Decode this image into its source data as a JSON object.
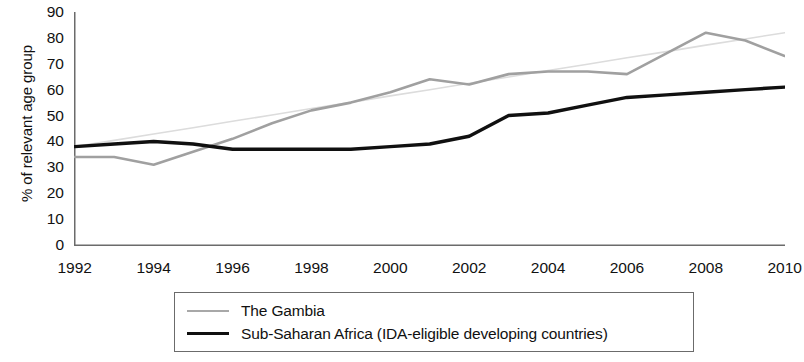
{
  "chart_data": {
    "type": "line",
    "title": "",
    "xlabel": "",
    "ylabel": "% of relevant age group",
    "xlim": [
      1992,
      2010
    ],
    "ylim": [
      0,
      90
    ],
    "grid": false,
    "legend_position": "bottom",
    "x": [
      1992,
      1993,
      1994,
      1995,
      1996,
      1997,
      1998,
      1999,
      2000,
      2001,
      2002,
      2003,
      2004,
      2005,
      2006,
      2007,
      2008,
      2009,
      2010
    ],
    "xticks": [
      1992,
      1994,
      1996,
      1998,
      2000,
      2002,
      2004,
      2006,
      2008,
      2010
    ],
    "xtick_labels": [
      "1992",
      "1994",
      "1996",
      "1998",
      "2000",
      "2002",
      "2004",
      "2006",
      "2008",
      "2010"
    ],
    "yticks": [
      0,
      10,
      20,
      30,
      40,
      50,
      60,
      70,
      80,
      90
    ],
    "ytick_labels": [
      "0",
      "10",
      "20",
      "30",
      "40",
      "50",
      "60",
      "70",
      "80",
      "90"
    ],
    "series": [
      {
        "name": "The Gambia",
        "color": "#a0a0a0",
        "values": [
          34,
          34,
          31,
          36,
          41,
          47,
          52,
          55,
          59,
          64,
          62,
          66,
          67,
          67,
          66,
          74,
          82,
          79,
          73
        ]
      },
      {
        "name": "Sub-Saharan Africa (IDA-eligible developing countries)",
        "color": "#101010",
        "values": [
          38,
          39,
          40,
          39,
          37,
          37,
          37,
          37,
          38,
          39,
          42,
          50,
          51,
          54,
          57,
          58,
          59,
          60,
          61
        ]
      },
      {
        "name": "trendline",
        "color": "#dcdcdc",
        "values": [
          38,
          40.4,
          42.9,
          45.3,
          47.8,
          50.2,
          52.7,
          55.1,
          57.6,
          60.0,
          62.5,
          64.9,
          67.4,
          69.8,
          72.3,
          74.7,
          77.2,
          79.6,
          82
        ]
      }
    ]
  },
  "legend": {
    "items": [
      {
        "label": "The Gambia",
        "swatch": "gambia"
      },
      {
        "label": "Sub-Saharan Africa (IDA-eligible developing countries)",
        "swatch": "ssa"
      }
    ]
  },
  "colors": {
    "gambia_line": "#a0a0a0",
    "ssa_line": "#101010",
    "trend_line": "#dcdcdc",
    "axis": "#6b6b6b",
    "text": "#111111"
  }
}
